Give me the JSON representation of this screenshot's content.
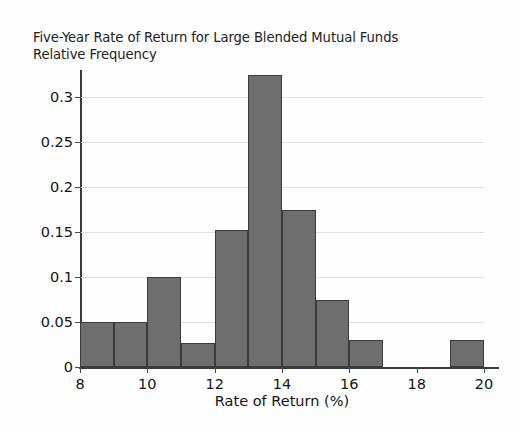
{
  "chart_data": {
    "type": "bar",
    "title": "Five-Year Rate of Return for Large Blended Mutual Funds",
    "subtitle": "Relative Frequency",
    "xlabel": "Rate of Return (%)",
    "ylabel": "Relative Frequency",
    "xlim": [
      8,
      20
    ],
    "ylim": [
      0,
      0.36
    ],
    "grid": true,
    "legend": null,
    "xticks": [
      "8",
      "10",
      "12",
      "14",
      "16",
      "18",
      "20"
    ],
    "xtick_values": [
      8,
      10,
      12,
      14,
      16,
      18,
      20
    ],
    "yticks": [
      "0",
      "0.05",
      "0.1",
      "0.15",
      "0.2",
      "0.25",
      "0.3"
    ],
    "ytick_values": [
      0,
      0.05,
      0.1,
      0.15,
      0.2,
      0.25,
      0.3
    ],
    "bin_width": 1,
    "bin_edges": [
      8,
      9,
      10,
      11,
      12,
      13,
      14,
      15,
      16,
      17,
      18,
      19,
      20
    ],
    "categories": [
      "8-9",
      "9-10",
      "10-11",
      "11-12",
      "12-13",
      "13-14",
      "14-15",
      "15-16",
      "16-17",
      "17-18",
      "18-19",
      "19-20"
    ],
    "values": [
      0.05,
      0.05,
      0.1,
      0.027,
      0.152,
      0.325,
      0.175,
      0.075,
      0.03,
      0,
      0,
      0.03
    ],
    "bar_color": "#6e6e6e",
    "bar_edge_color": "#3b3b3b",
    "grid_color": "#e2e2e2",
    "axis_color": "#3a3a3a"
  }
}
